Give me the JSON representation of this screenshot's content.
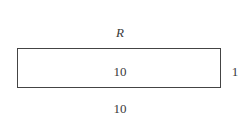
{
  "diagram": {
    "shape": "rectangle",
    "name_label": "R",
    "inner_label": "10",
    "height_label": "1",
    "width_label": "10",
    "stroke_color": "#444444",
    "text_color": "#3a3a3a",
    "background": "#ffffff"
  }
}
